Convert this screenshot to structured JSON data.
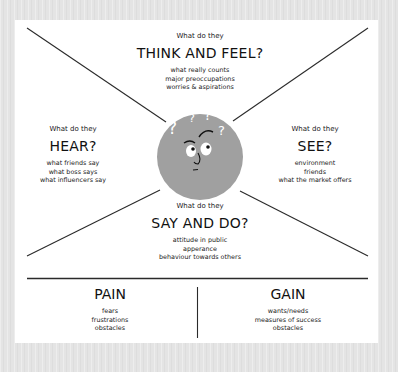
{
  "colors": {
    "background": "#e4e4e4",
    "card": "#ffffff",
    "lines": "#2a2a2a",
    "face": "#9e9e9e"
  },
  "quadrants": {
    "think_feel": {
      "prompt": "What do they",
      "heading": "THINK AND FEEL?",
      "items": [
        "what really counts",
        "major preoccupations",
        "worries & aspirations"
      ]
    },
    "hear": {
      "prompt": "What do they",
      "heading": "HEAR?",
      "items": [
        "what friends say",
        "what boss says",
        "what influencers say"
      ]
    },
    "see": {
      "prompt": "What do they",
      "heading": "SEE?",
      "items": [
        "environment",
        "friends",
        "what the market offers"
      ]
    },
    "say_do": {
      "prompt": "What do they",
      "heading": "SAY AND DO?",
      "items": [
        "attitude in public",
        "apperance",
        "behaviour towards others"
      ]
    }
  },
  "bottom": {
    "pain": {
      "heading": "PAIN",
      "items": [
        "fears",
        "frustrations",
        "obstacles"
      ]
    },
    "gain": {
      "heading": "GAIN",
      "items": [
        "wants/needs",
        "measures of success",
        "obstacles"
      ]
    }
  },
  "center": {
    "icon": "confused-face-icon",
    "marks": [
      "?",
      "?",
      "?",
      "?"
    ]
  }
}
